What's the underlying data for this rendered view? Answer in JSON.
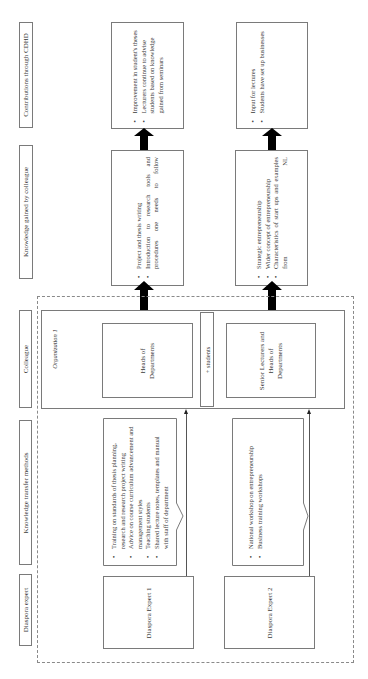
{
  "headers": {
    "contributions": "Contributions through CDHD",
    "knowledge_gained": "Knowledge gained by colleague",
    "colleague": "Colleague",
    "transfer_methods": "Knowledge transfer methods",
    "diaspora_expert": "Diaspora expert"
  },
  "contributions": {
    "left": [
      "Improvement in student's theses",
      "Lecturers continue to advise students based on knowledge gained from seminars"
    ],
    "right": [
      "Input for lectures",
      "Students have set up businesses"
    ]
  },
  "knowledge": {
    "left": [
      "Project and thesis writing",
      "Introduction to research tools and procedures one needs to follow"
    ],
    "right": [
      "Strategic entrepreneurship",
      "Wider concept of entrepreneurship",
      "Characteristics of start ups and examples from NL"
    ]
  },
  "colleague": {
    "organization_label": "Organization 1",
    "left": "Heads of Departments",
    "plus_students": "+ students",
    "right": "Senior Lecturers and Heads of Departments"
  },
  "methods": {
    "left": [
      "Training on standards of thesis planning, research and research project writing",
      "Advice on course curriculum advancement and management styles",
      "Teaching students",
      "Shared lecture notes, templates and manual with staff of department"
    ],
    "right": [
      "National workshop on entrepreneurship",
      "Business training workshops"
    ]
  },
  "experts": {
    "left": "Diaspora Expert 1",
    "right": "Diaspora Expert 2"
  },
  "colors": {
    "border": "#7a7a7a",
    "arrow": "#000000",
    "dashed": "#8a8a8a"
  }
}
